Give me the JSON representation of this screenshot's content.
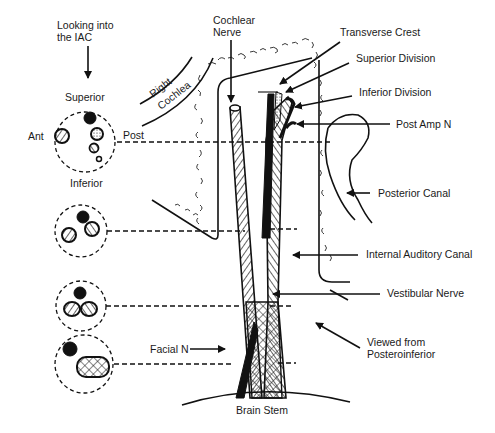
{
  "figure": {
    "type": "anatomical-diagram",
    "colors": {
      "ink": "#111111",
      "background": "#ffffff"
    }
  },
  "labels": {
    "looking_into_1": "Looking into",
    "looking_into_2": "the IAC",
    "superior": "Superior",
    "inferior": "Inferior",
    "ant": "Ant",
    "post": "Post",
    "right": "Right",
    "cochlea": "Cochlea",
    "cochlear_nerve_1": "Cochlear",
    "cochlear_nerve_2": "Nerve",
    "transverse_crest": "Transverse Crest",
    "superior_division": "Superior Division",
    "inferior_division": "Inferior Division",
    "post_amp_n": "Post Amp N",
    "posterior_canal": "Posterior Canal",
    "internal_auditory_canal": "Internal Auditory Canal",
    "vestibular_nerve": "Vestibular Nerve",
    "viewed_from_1": "Viewed from",
    "viewed_from_2": "Posteroinferior",
    "facial_n": "Facial N",
    "brain_stem": "Brain Stem"
  },
  "cross_sections": [
    {
      "level": 1,
      "description": "Four separate nerves: facial (solid), cochlear (hatched, anterior), superior vestibular (stippled), inferior vestibular (hatched), posterior ampullary (small)"
    },
    {
      "level": 2,
      "description": "Facial (solid), cochlear (hatched), vestibular (hatched)"
    },
    {
      "level": 3,
      "description": "Facial (solid), cochlear and vestibular nerves adjacent"
    },
    {
      "level": 4,
      "description": "Facial (solid), merged cochleovestibular nerve (cross-hatched)"
    }
  ]
}
